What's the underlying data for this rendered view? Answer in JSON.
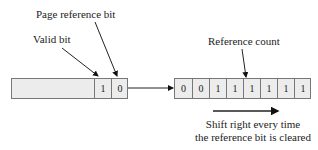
{
  "labels": {
    "page_reference_bit": "Page reference bit",
    "valid_bit": "Valid bit",
    "reference_count": "Reference count"
  },
  "page_table_entry": {
    "valid_bit_value": "1",
    "reference_bit_value": "0"
  },
  "reference_counter": {
    "bits": [
      "0",
      "0",
      "1",
      "1",
      "1",
      "1",
      "1",
      "1"
    ]
  },
  "caption": {
    "line1": "Shift right every time",
    "line2": "the reference bit is cleared"
  },
  "colors": {
    "box_fill": "#ececec",
    "stroke": "#222222"
  }
}
